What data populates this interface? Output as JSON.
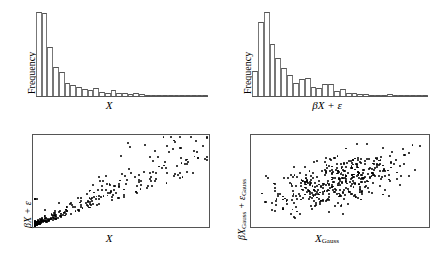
{
  "figure": {
    "panels": [
      "hist-x",
      "hist-bx-eps",
      "scatter-x-vs-bx-eps",
      "scatter-gauss"
    ]
  },
  "labels": {
    "frequency": "Frequency",
    "x": "X",
    "beta": "β",
    "epsilon": "ε",
    "plus": " + ",
    "gauss_sub": "Gauss"
  },
  "chart_data": [
    {
      "id": "hist-x",
      "type": "bar",
      "title": "",
      "xlabel": "X",
      "ylabel": "Frequency",
      "grid": false,
      "legend": false,
      "categories": [
        "1",
        "2",
        "3",
        "4",
        "5",
        "6",
        "7",
        "8",
        "9",
        "10",
        "11",
        "12",
        "13",
        "14",
        "15",
        "16",
        "17",
        "18",
        "19",
        "20",
        "21",
        "22",
        "23",
        "24",
        "25",
        "26",
        "27",
        "28",
        "29",
        "30"
      ],
      "values": [
        100,
        99,
        58,
        35,
        28,
        16,
        13,
        11,
        8,
        7,
        9,
        5,
        4,
        7,
        4,
        3,
        2,
        4,
        2,
        1,
        1,
        1,
        1,
        0.6,
        1.2,
        0.5,
        0.4,
        0.8,
        0.3,
        0.6
      ],
      "ylim": [
        0,
        100
      ],
      "note": "Strongly right-skewed, power-law-like decay with a long thin tail"
    },
    {
      "id": "hist-bx-eps",
      "type": "bar",
      "title": "",
      "xlabel": "βX + ε",
      "ylabel": "Frequency",
      "grid": false,
      "legend": false,
      "categories": [
        "1",
        "2",
        "3",
        "4",
        "5",
        "6",
        "7",
        "8",
        "9",
        "10",
        "11",
        "12",
        "13",
        "14",
        "15",
        "16",
        "17",
        "18",
        "19",
        "20",
        "21",
        "22",
        "23",
        "24",
        "25",
        "26",
        "27",
        "28",
        "29",
        "30"
      ],
      "values": [
        30,
        88,
        100,
        62,
        45,
        33,
        25,
        16,
        20,
        21,
        11,
        10,
        14,
        14,
        6,
        8,
        4,
        3,
        2,
        2,
        1,
        1,
        1,
        2,
        1,
        0.6,
        1.5,
        0.5,
        1,
        1
      ],
      "ylim": [
        0,
        100
      ],
      "note": "Right-skewed with a short first bin, peak at the third bin, and a long sparse tail"
    },
    {
      "id": "scatter-x-vs-bx-eps",
      "type": "scatter",
      "title": "",
      "xlabel": "X",
      "ylabel": "βX + ε",
      "grid": false,
      "legend": false,
      "xlim": [
        0,
        1
      ],
      "ylim": [
        0,
        1
      ],
      "n_points": 430,
      "note": "Dense wedge-shaped cluster pinned to the lower-left origin, fanning out to the right with increasing variance (heteroscedastic); a few extreme outliers high and far right"
    },
    {
      "id": "scatter-gauss",
      "type": "scatter",
      "title": "",
      "xlabel": "X_Gauss",
      "ylabel": "βX_Gauss + ε_Gauss",
      "grid": false,
      "legend": false,
      "xlim": [
        0,
        1
      ],
      "ylim": [
        0,
        1
      ],
      "n_points": 430,
      "note": "Elliptical bivariate Gaussian cloud centred in the panel with a moderate positive correlation"
    }
  ]
}
